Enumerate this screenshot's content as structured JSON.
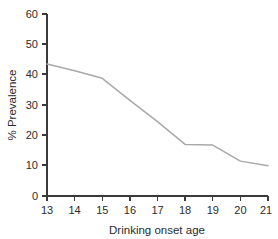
{
  "chart_data": {
    "type": "line",
    "title": "",
    "subtitle": "",
    "xlabel": "Drinking onset age",
    "ylabel": "% Prevalence",
    "x": [
      13,
      14,
      15,
      16,
      17,
      18,
      19,
      20,
      21
    ],
    "values": [
      43.5,
      41.3,
      38.8,
      31.5,
      24.5,
      17.0,
      16.8,
      11.5,
      10.0
    ],
    "series": [
      {
        "name": "Prevalence",
        "values": [
          43.5,
          41.3,
          38.8,
          31.5,
          24.5,
          17.0,
          16.8,
          11.5,
          10.0
        ]
      }
    ],
    "xtick_labels": [
      "13",
      "14",
      "15",
      "16",
      "17",
      "18",
      "19",
      "20",
      "21"
    ],
    "ytick_labels": [
      "0",
      "10",
      "20",
      "30",
      "40",
      "50",
      "60"
    ],
    "yticks": [
      0,
      10,
      20,
      30,
      40,
      50,
      60
    ],
    "xlim": [
      13,
      21
    ],
    "ylim": [
      0,
      60
    ],
    "grid": false,
    "legend": false,
    "legend_position": "none",
    "line_color": "#a9a9a9",
    "axis_color": "#3a3a3a",
    "text_color": "#2b2b2b",
    "background_color": "#ffffff"
  }
}
